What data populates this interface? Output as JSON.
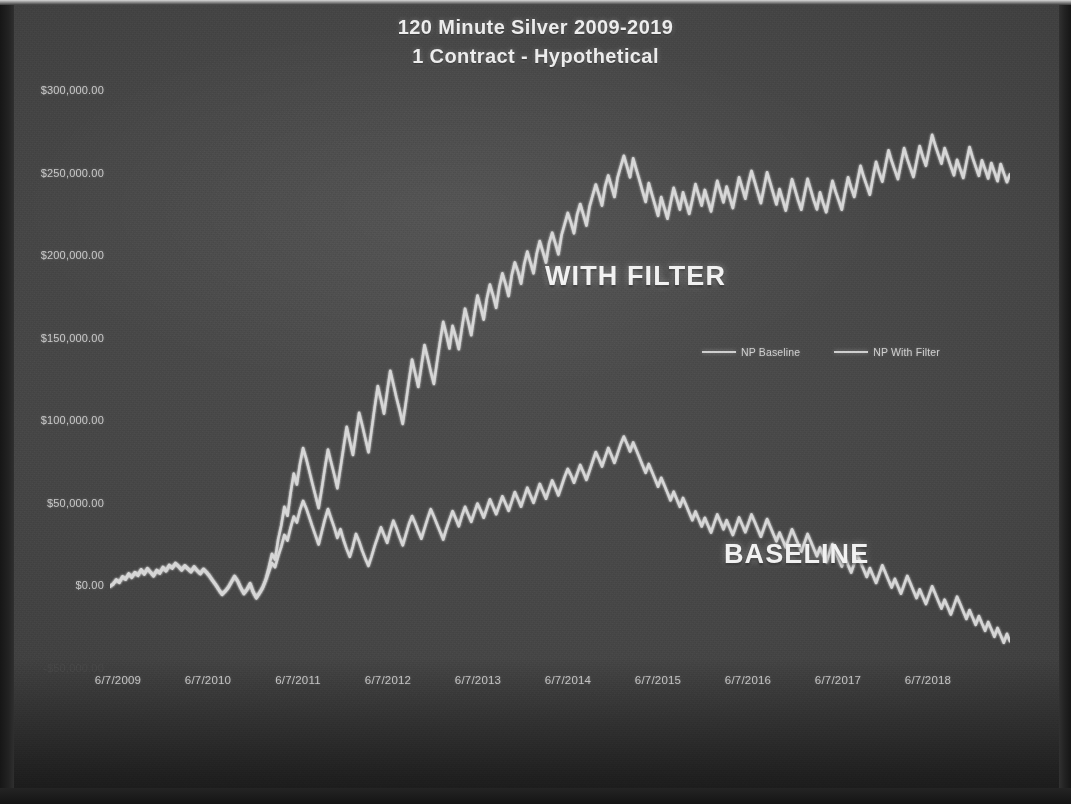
{
  "chart_data": {
    "type": "line",
    "title": "120 Minute Silver 2009-2019",
    "subtitle": "1 Contract - Hypothetical",
    "xlabel": "",
    "ylabel": "",
    "grid": false,
    "legend_position": "inside-upper-right",
    "xlim": [
      "6/7/2009",
      "6/7/2019"
    ],
    "ylim": [
      -50000,
      300000
    ],
    "ytick_labels": [
      "$300,000.00",
      "$250,000.00",
      "$200,000.00",
      "$150,000.00",
      "$100,000.00",
      "$50,000.00",
      "$0.00",
      "-$50,000.00"
    ],
    "ytick_values": [
      300000,
      250000,
      200000,
      150000,
      100000,
      50000,
      0,
      -50000
    ],
    "xtick_labels": [
      "6/7/2009",
      "6/7/2010",
      "6/7/2011",
      "6/7/2012",
      "6/7/2013",
      "6/7/2014",
      "6/7/2015",
      "6/7/2016",
      "6/7/2017",
      "6/7/2018"
    ],
    "annotations": [
      {
        "text": "WITH FILTER",
        "series": "NP With Filter"
      },
      {
        "text": "BASELINE",
        "series": "NP Baseline"
      }
    ],
    "series": [
      {
        "name": "NP Baseline",
        "color": "#d2d2d2",
        "values": [
          0,
          1200,
          3800,
          2200,
          5600,
          4100,
          7300,
          5200,
          8100,
          6400,
          9800,
          7200,
          10500,
          8300,
          6100,
          9400,
          7800,
          11200,
          9100,
          12400,
          10800,
          13600,
          11900,
          9700,
          12200,
          10400,
          8600,
          11500,
          9300,
          7400,
          10100,
          8200,
          5900,
          3100,
          600,
          -2400,
          -5100,
          -3200,
          -900,
          2400,
          5800,
          2900,
          -1200,
          -4600,
          -2100,
          1400,
          -3800,
          -7200,
          -4300,
          -1100,
          3600,
          8900,
          14200,
          11600,
          18400,
          24100,
          31200,
          27800,
          35600,
          42300,
          38700,
          46200,
          51800,
          47400,
          41900,
          36200,
          30800,
          25400,
          33100,
          40600,
          46900,
          41200,
          35800,
          29400,
          34700,
          28100,
          22600,
          17900,
          24300,
          31800,
          27200,
          21600,
          16800,
          12400,
          18200,
          24600,
          30100,
          35800,
          31200,
          26400,
          33600,
          39800,
          35100,
          29700,
          24900,
          31400,
          37800,
          42600,
          38200,
          33400,
          28900,
          35100,
          41200,
          46800,
          42300,
          37600,
          33100,
          28400,
          34800,
          40200,
          45600,
          41100,
          36400,
          42800,
          48200,
          43600,
          39100,
          44800,
          50200,
          46100,
          41600,
          47200,
          52800,
          48300,
          43700,
          49100,
          54600,
          50200,
          45800,
          51400,
          57200,
          52800,
          48300,
          54100,
          59800,
          55200,
          50600,
          56400,
          62100,
          57600,
          53100,
          58800,
          64200,
          59700,
          55100,
          60800,
          66400,
          71200,
          67400,
          62800,
          68200,
          73600,
          69100,
          64500,
          70200,
          75800,
          81400,
          77200,
          72600,
          78300,
          83900,
          79400,
          74800,
          80600,
          86200,
          90800,
          86400,
          81700,
          87200,
          82600,
          78100,
          73400,
          68800,
          74200,
          69600,
          65100,
          60400,
          65800,
          61200,
          56700,
          52100,
          57400,
          52800,
          48200,
          53600,
          49100,
          44600,
          40100,
          45400,
          40800,
          36300,
          41600,
          37100,
          32600,
          38200,
          43600,
          39100,
          34600,
          40100,
          35600,
          31100,
          36400,
          41800,
          37300,
          32800,
          38100,
          43600,
          39100,
          34600,
          30100,
          35400,
          40800,
          36300,
          31800,
          27300,
          32600,
          28100,
          23600,
          29100,
          34600,
          30100,
          25600,
          21100,
          26400,
          31800,
          27300,
          22800,
          18300,
          23600,
          19100,
          14600,
          20100,
          25600,
          21100,
          16600,
          12100,
          17400,
          12900,
          8400,
          13800,
          19200,
          14700,
          10200,
          5700,
          11100,
          6600,
          2100,
          7400,
          12800,
          8300,
          3800,
          -700,
          4600,
          100,
          -4400,
          1000,
          6400,
          1900,
          -2600,
          -7100,
          -1700,
          -6200,
          -10700,
          -5300,
          100,
          -4400,
          -8900,
          -13400,
          -8000,
          -12500,
          -17000,
          -11600,
          -6200,
          -10700,
          -15200,
          -19700,
          -14300,
          -18800,
          -23300,
          -17900,
          -22400,
          -26900,
          -21500,
          -26000,
          -30500,
          -25100,
          -29600,
          -34100,
          -28700,
          -33200
        ]
      },
      {
        "name": "NP With Filter",
        "color": "#dcdcdc",
        "values": [
          0,
          1600,
          4200,
          2800,
          6100,
          4600,
          7900,
          5800,
          8700,
          7000,
          10400,
          7800,
          11100,
          8900,
          6700,
          10000,
          8400,
          11800,
          9700,
          13000,
          11400,
          14200,
          12500,
          10300,
          12800,
          11000,
          9200,
          12100,
          9900,
          8000,
          10700,
          8800,
          6500,
          3700,
          1200,
          -1800,
          -4500,
          -2600,
          -300,
          3000,
          6400,
          3500,
          -600,
          -4000,
          -1500,
          2000,
          -3200,
          -6600,
          -3700,
          -500,
          4200,
          11600,
          19800,
          16200,
          28400,
          37100,
          48200,
          42800,
          56600,
          68300,
          61700,
          74200,
          83800,
          77400,
          69900,
          62200,
          54800,
          47400,
          59100,
          71600,
          82900,
          75200,
          67800,
          59400,
          71700,
          84100,
          96600,
          88100,
          79600,
          92400,
          105200,
          97600,
          89400,
          81200,
          94800,
          108600,
          121400,
          113200,
          104600,
          117800,
          130600,
          122400,
          114100,
          106800,
          98400,
          111200,
          124600,
          137400,
          129100,
          120800,
          133600,
          146200,
          138400,
          130100,
          122600,
          135800,
          148400,
          160200,
          152600,
          144100,
          157800,
          151200,
          143600,
          156400,
          168200,
          160600,
          152100,
          164800,
          176200,
          169100,
          161600,
          174200,
          182800,
          176300,
          168700,
          181100,
          189600,
          183200,
          175800,
          188400,
          196200,
          190800,
          183300,
          195100,
          202800,
          196200,
          189600,
          201400,
          209100,
          202600,
          196100,
          207800,
          214200,
          207700,
          201100,
          212800,
          219400,
          226200,
          220400,
          213800,
          225200,
          231600,
          225100,
          218500,
          230200,
          236800,
          243400,
          237200,
          230600,
          242300,
          248900,
          242400,
          235800,
          247600,
          254200,
          260800,
          254400,
          247700,
          259200,
          252600,
          246100,
          239400,
          232800,
          244200,
          237600,
          231100,
          224400,
          235800,
          229200,
          222700,
          232100,
          241400,
          234800,
          228200,
          238600,
          232100,
          225600,
          234100,
          243600,
          237100,
          230600,
          240100,
          233600,
          227100,
          236200,
          245600,
          239100,
          232600,
          242100,
          235600,
          229100,
          238400,
          247800,
          241300,
          234800,
          244100,
          251600,
          245100,
          238600,
          232100,
          241400,
          250800,
          244300,
          237800,
          231300,
          240600,
          234100,
          227600,
          237100,
          246600,
          240100,
          233600,
          228100,
          237400,
          246800,
          240300,
          233800,
          228300,
          238600,
          232100,
          226600,
          236100,
          245600,
          239100,
          233600,
          228100,
          238400,
          247800,
          241300,
          235800,
          245200,
          254700,
          248200,
          242700,
          237200,
          247600,
          257100,
          250600,
          245100,
          254600,
          264100,
          257600,
          252100,
          246600,
          256000,
          265400,
          258900,
          253400,
          247900,
          257300,
          266700,
          260200,
          254700,
          264100,
          273500,
          267000,
          261500,
          256000,
          265400,
          259900,
          254400,
          248900,
          258300,
          252800,
          247300,
          256700,
          266100,
          259600,
          254100,
          248600,
          258000,
          252500,
          247000,
          256400,
          250900,
          245400,
          255800,
          250300,
          244800,
          249600
        ]
      }
    ]
  },
  "legend": {
    "entries": [
      {
        "label": "NP Baseline"
      },
      {
        "label": "NP With Filter"
      }
    ]
  }
}
